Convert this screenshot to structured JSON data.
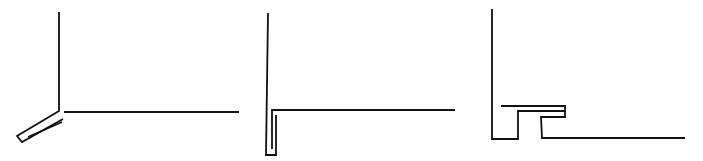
{
  "figure": {
    "stroke_color": "#111111",
    "background": "#ffffff",
    "panels": [
      {
        "id": "panel-1",
        "description": "Vertical wall line meeting horizontal floor line with angled double-line flashing strip",
        "paths": [
          "M59,12 L59,111 L17,136 L22,142 L63,119",
          "M64,112 L239,112",
          "M28,137 L62,122"
        ]
      },
      {
        "id": "panel-2",
        "description": "Vertical wall line with horizontal line and narrow U-shaped folded hem at junction",
        "paths": [
          "M268,13 L266,155 L276,155 L276,115",
          "M272,149 L272,110 L455,110"
        ]
      },
      {
        "id": "panel-3",
        "description": "Vertical wall line with stepped Z-profile flange leading to horizontal base line",
        "paths": [
          "M492,9 L492,139 L518,139 L518,111 L565,111 L565,106 L501,106",
          "M565,111 L565,117 L541,117 L542,138 L685,138"
        ]
      }
    ]
  }
}
